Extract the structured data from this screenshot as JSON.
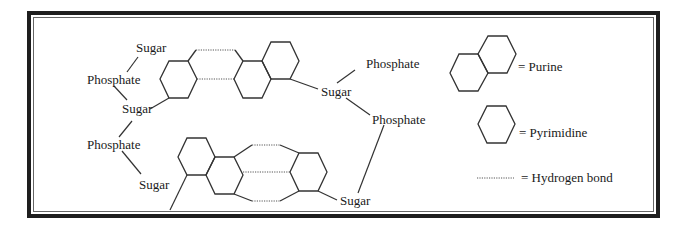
{
  "figure": {
    "labels": {
      "sugar_top_left": "Sugar",
      "phosphate_left_1": "Phosphate",
      "sugar_mid_left": "Sugar",
      "phosphate_left_2": "Phosphate",
      "sugar_bottom_left": "Sugar",
      "sugar_right_mid": "Sugar",
      "phosphate_right_top": "Phosphate",
      "phosphate_right_mid": "Phosphate",
      "sugar_bottom_right": "Sugar"
    },
    "legend": {
      "purine": "= Purine",
      "pyrimidine": "= Pyrimidine",
      "hydrogen_bond": "= Hydrogen bond"
    },
    "colors": {
      "frame": "#1e1e1e",
      "lines": "#333333",
      "text": "#1a1a1a"
    }
  }
}
